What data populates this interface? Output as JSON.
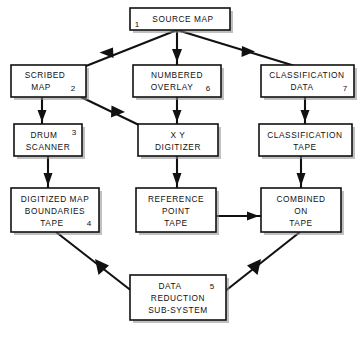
{
  "diagram": {
    "background_color": "#ffffff",
    "line_color": "#111111",
    "nodes": [
      {
        "id": "source-map",
        "number": "1",
        "number_pos": "bottom-left",
        "lines": [
          "SOURCE MAP"
        ],
        "x": 130,
        "y": 8,
        "w": 100,
        "h": 22
      },
      {
        "id": "scribed-map",
        "number": "2",
        "number_pos": "inline-right",
        "lines": [
          "SCRIBED",
          "MAP"
        ],
        "x": 11,
        "y": 65,
        "w": 75,
        "h": 32
      },
      {
        "id": "numbered-overlay",
        "number": "6",
        "number_pos": "inline-right",
        "lines": [
          "NUMBERED",
          "OVERLAY"
        ],
        "x": 133,
        "y": 65,
        "w": 88,
        "h": 32
      },
      {
        "id": "classification-data",
        "number": "7",
        "number_pos": "bottom-right",
        "lines": [
          "CLASSIFICATION",
          "DATA"
        ],
        "x": 261,
        "y": 65,
        "w": 93,
        "h": 32
      },
      {
        "id": "drum-scanner",
        "number": "3",
        "number_pos": "top-right",
        "lines": [
          "DRUM",
          "SCANNER"
        ],
        "x": 14,
        "y": 124,
        "w": 68,
        "h": 32
      },
      {
        "id": "xy-digitizer",
        "number": "",
        "number_pos": "",
        "lines": [
          "X  Y",
          "DIGITIZER"
        ],
        "x": 138,
        "y": 124,
        "w": 80,
        "h": 32
      },
      {
        "id": "classification-tape",
        "number": "",
        "number_pos": "",
        "lines": [
          "CLASSIFICATION",
          "TAPE"
        ],
        "x": 259,
        "y": 124,
        "w": 93,
        "h": 32
      },
      {
        "id": "digitized-map-boundaries-tape",
        "number": "4",
        "number_pos": "bottom-right",
        "lines": [
          "DIGITIZED MAP",
          "BOUNDARIES",
          "TAPE"
        ],
        "x": 11,
        "y": 188,
        "w": 88,
        "h": 44
      },
      {
        "id": "reference-point-tape",
        "number": "",
        "number_pos": "",
        "lines": [
          "REFERENCE",
          "POINT",
          "TAPE"
        ],
        "x": 136,
        "y": 188,
        "w": 80,
        "h": 44
      },
      {
        "id": "combined-on-tape",
        "number": "",
        "number_pos": "",
        "lines": [
          "COMBINED",
          "ON",
          "TAPE"
        ],
        "x": 261,
        "y": 188,
        "w": 80,
        "h": 44
      },
      {
        "id": "data-reduction-sub-system",
        "number": "5",
        "number_pos": "top-right",
        "lines": [
          "DATA",
          "REDUCTION",
          "SUB-SYSTEM"
        ],
        "x": 130,
        "y": 275,
        "w": 96,
        "h": 45
      }
    ],
    "connections": [
      {
        "id": "source-to-scribed",
        "from": "source-map",
        "to": "scribed-map",
        "style": "diagonal-left"
      },
      {
        "id": "source-to-numbered",
        "from": "source-map",
        "to": "numbered-overlay",
        "style": "vertical"
      },
      {
        "id": "source-to-classification",
        "from": "source-map",
        "to": "classification-data",
        "style": "diagonal-right"
      },
      {
        "id": "scribed-to-drum",
        "from": "scribed-map",
        "to": "drum-scanner",
        "style": "vertical"
      },
      {
        "id": "scribed-to-xy",
        "from": "scribed-map",
        "to": "xy-digitizer",
        "style": "diagonal-right"
      },
      {
        "id": "numbered-to-xy",
        "from": "numbered-overlay",
        "to": "xy-digitizer",
        "style": "vertical"
      },
      {
        "id": "classification-data-to-tape",
        "from": "classification-data",
        "to": "classification-tape",
        "style": "vertical"
      },
      {
        "id": "drum-to-digitized",
        "from": "drum-scanner",
        "to": "digitized-map-boundaries-tape",
        "style": "vertical"
      },
      {
        "id": "xy-to-reference",
        "from": "xy-digitizer",
        "to": "reference-point-tape",
        "style": "vertical"
      },
      {
        "id": "classification-tape-to-combined",
        "from": "classification-tape",
        "to": "combined-on-tape",
        "style": "vertical"
      },
      {
        "id": "reference-to-combined",
        "from": "reference-point-tape",
        "to": "combined-on-tape",
        "style": "horizontal"
      },
      {
        "id": "digitized-to-data-reduction",
        "from": "digitized-map-boundaries-tape",
        "to": "data-reduction-sub-system",
        "style": "diagonal-down-right"
      },
      {
        "id": "combined-to-data-reduction",
        "from": "combined-on-tape",
        "to": "data-reduction-sub-system",
        "style": "diagonal-down-left"
      }
    ]
  }
}
